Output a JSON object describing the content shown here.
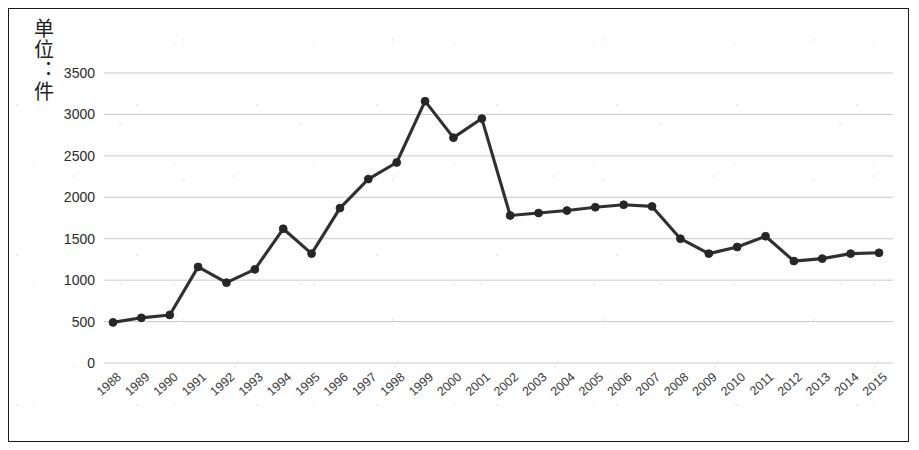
{
  "figure": {
    "y_axis_title": "单位：件",
    "border_color": "#1a1a1a",
    "line_color": "#303030",
    "marker_color": "#262626",
    "gridline_color": "#c9c9c9"
  },
  "chart_data": {
    "type": "line",
    "title": "",
    "subtitle": "",
    "xlabel": "",
    "ylabel": "单位：件",
    "grid": "horizontal",
    "legend": "none",
    "xlim": [
      "1988",
      "2015"
    ],
    "ylim": [
      0,
      3500
    ],
    "ytick_labels": [
      "0",
      "500",
      "1000",
      "1500",
      "2000",
      "2500",
      "3000",
      "3500"
    ],
    "ytick_values": [
      0,
      500,
      1000,
      1500,
      2000,
      2500,
      3000,
      3500
    ],
    "categories": [
      "1988",
      "1989",
      "1990",
      "1991",
      "1992",
      "1993",
      "1994",
      "1995",
      "1996",
      "1997",
      "1998",
      "1999",
      "2000",
      "2001",
      "2002",
      "2003",
      "2004",
      "2005",
      "2006",
      "2007",
      "2008",
      "2009",
      "2010",
      "2011",
      "2012",
      "2013",
      "2014",
      "2015"
    ],
    "series": [
      {
        "name": "件数",
        "values": [
          490,
          545,
          580,
          1160,
          970,
          1130,
          1620,
          1320,
          1870,
          2220,
          2420,
          3160,
          2720,
          2950,
          1780,
          1810,
          1840,
          1880,
          1910,
          1890,
          1500,
          1320,
          1400,
          1530,
          1230,
          1260,
          1320,
          1330
        ]
      }
    ]
  }
}
